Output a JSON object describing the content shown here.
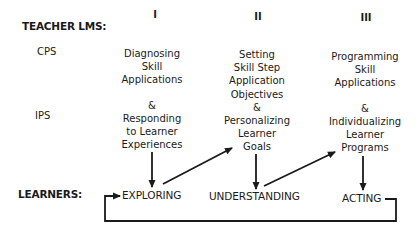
{
  "header": {
    "teacher_label": "TEACHER LMS:",
    "learners_label": "LEARNERS:"
  },
  "rows": {
    "cps": "CPS",
    "ips": "IPS"
  },
  "columns": [
    {
      "numeral": "I",
      "cps_lines": [
        "Diagnosing",
        "Skill",
        "Applications"
      ],
      "ips_lines": [
        "&",
        "Responding",
        "to Learner",
        "Experiences"
      ],
      "stage": "EXPLORING"
    },
    {
      "numeral": "II",
      "cps_lines": [
        "Setting",
        "Skill Step",
        "Application",
        "Objectives"
      ],
      "ips_lines": [
        "&",
        "Personalizing",
        "Learner",
        "Goals"
      ],
      "stage": "UNDERSTANDING"
    },
    {
      "numeral": "III",
      "cps_lines": [
        "Programming",
        "Skill",
        "Applications"
      ],
      "ips_lines": [
        "&",
        "Individualizing",
        "Learner",
        "Programs"
      ],
      "stage": "ACTING"
    }
  ],
  "colors": {
    "ink": "#1a1a1a",
    "background": "#ffffff"
  }
}
